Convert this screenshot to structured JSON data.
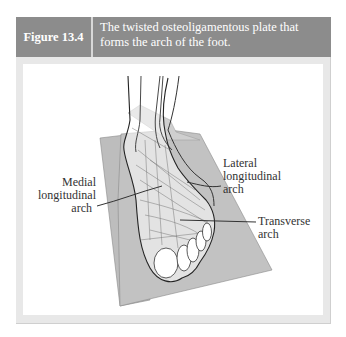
{
  "figure": {
    "number": "Figure 13.4",
    "caption_line1": "The twisted osteoligamentous plate that",
    "caption_line2": "forms the arch of the foot."
  },
  "labels": {
    "medial": {
      "line1": "Medial",
      "line2": "longitudinal",
      "line3": "arch"
    },
    "lateral": {
      "line1": "Lateral",
      "line2": "longitudinal",
      "line3": "arch"
    },
    "transverse": {
      "line1": "Transverse",
      "line2": "arch"
    }
  },
  "colors": {
    "header_bg": "#8c8c8c",
    "panel_border": "#e8e8e8",
    "plate": "#bdbdbd",
    "line": "#333333"
  }
}
